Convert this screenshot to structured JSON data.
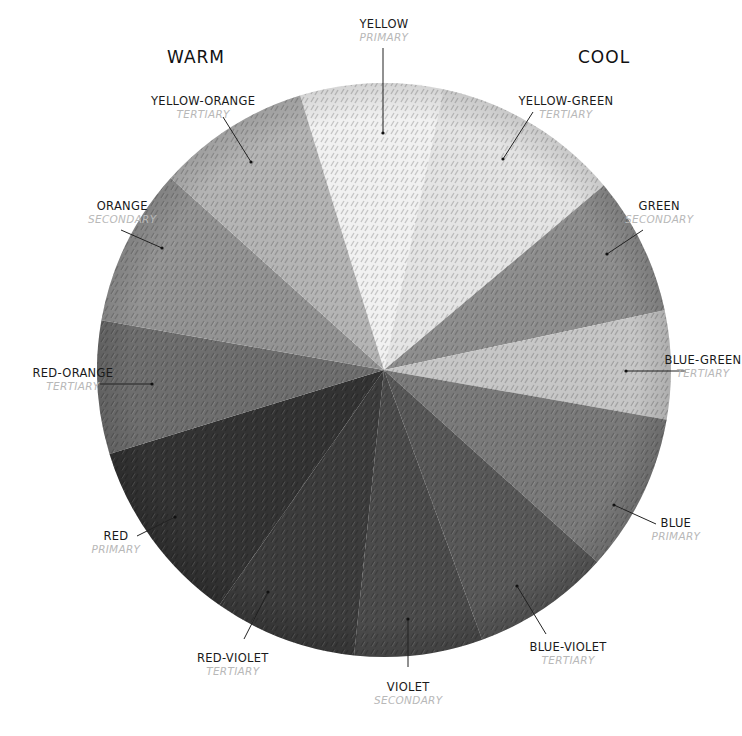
{
  "headings": {
    "warm": "WARM",
    "cool": "COOL"
  },
  "wheel": {
    "center": [
      384,
      370
    ],
    "radius": 287,
    "segments": [
      {
        "name": "YELLOW",
        "kind": "PRIMARY",
        "start": -17,
        "end": 12,
        "shade": "#f1f1f1"
      },
      {
        "name": "YELLOW-GREEN",
        "kind": "TERTIARY",
        "start": 12,
        "end": 50,
        "shade": "#e4e4e4"
      },
      {
        "name": "GREEN",
        "kind": "SECONDARY",
        "start": 50,
        "end": 78,
        "shade": "#8e8e8e"
      },
      {
        "name": "BLUE-GREEN",
        "kind": "TERTIARY",
        "start": 78,
        "end": 100,
        "shade": "#c6c6c6"
      },
      {
        "name": "BLUE",
        "kind": "PRIMARY",
        "start": 100,
        "end": 132,
        "shade": "#7a7a7a"
      },
      {
        "name": "BLUE-VIOLET",
        "kind": "TERTIARY",
        "start": 132,
        "end": 160,
        "shade": "#585858"
      },
      {
        "name": "VIOLET",
        "kind": "SECONDARY",
        "start": 160,
        "end": 186,
        "shade": "#4b4b4b"
      },
      {
        "name": "RED-VIOLET",
        "kind": "TERTIARY",
        "start": 186,
        "end": 215,
        "shade": "#3c3c3c"
      },
      {
        "name": "RED",
        "kind": "PRIMARY",
        "start": 215,
        "end": 253,
        "shade": "#333333"
      },
      {
        "name": "RED-ORANGE",
        "kind": "TERTIARY",
        "start": 253,
        "end": 280,
        "shade": "#6e6e6e"
      },
      {
        "name": "ORANGE",
        "kind": "SECONDARY",
        "start": 280,
        "end": 312,
        "shade": "#939393"
      },
      {
        "name": "YELLOW-ORANGE",
        "kind": "TERTIARY",
        "start": 312,
        "end": 343,
        "shade": "#b4b4b4"
      }
    ]
  },
  "labels": [
    {
      "name": "YELLOW",
      "kind": "PRIMARY",
      "x": 384,
      "y": 18,
      "align": "center",
      "line": [
        [
          383,
          48
        ],
        [
          383,
          133
        ]
      ]
    },
    {
      "name": "YELLOW-ORANGE",
      "kind": "TERTIARY",
      "x": 203,
      "y": 95,
      "align": "center",
      "line": [
        [
          223,
          117
        ],
        [
          251,
          162
        ]
      ]
    },
    {
      "name": "YELLOW-GREEN",
      "kind": "TERTIARY",
      "x": 566,
      "y": 95,
      "align": "center",
      "line": [
        [
          533,
          112
        ],
        [
          503,
          159
        ]
      ]
    },
    {
      "name": "ORANGE",
      "kind": "SECONDARY",
      "x": 122,
      "y": 200,
      "align": "center",
      "line": [
        [
          121,
          230
        ],
        [
          162,
          248
        ]
      ]
    },
    {
      "name": "GREEN",
      "kind": "SECONDARY",
      "x": 659,
      "y": 200,
      "align": "center",
      "line": [
        [
          643,
          230
        ],
        [
          607,
          254
        ]
      ]
    },
    {
      "name": "RED-ORANGE",
      "kind": "TERTIARY",
      "x": 73,
      "y": 367,
      "align": "center",
      "line": [
        [
          100,
          384
        ],
        [
          152,
          384
        ]
      ]
    },
    {
      "name": "BLUE-GREEN",
      "kind": "TERTIARY",
      "x": 703,
      "y": 354,
      "align": "center",
      "line": [
        [
          686,
          371
        ],
        [
          626,
          371
        ]
      ]
    },
    {
      "name": "RED",
      "kind": "PRIMARY",
      "x": 116,
      "y": 530,
      "align": "center",
      "line": [
        [
          137,
          536
        ],
        [
          175,
          517
        ]
      ]
    },
    {
      "name": "BLUE",
      "kind": "PRIMARY",
      "x": 676,
      "y": 517,
      "align": "center",
      "line": [
        [
          656,
          524
        ],
        [
          614,
          505
        ]
      ]
    },
    {
      "name": "RED-VIOLET",
      "kind": "TERTIARY",
      "x": 233,
      "y": 652,
      "align": "center",
      "line": [
        [
          244,
          639
        ],
        [
          268,
          592
        ]
      ]
    },
    {
      "name": "VIOLET",
      "kind": "SECONDARY",
      "x": 408,
      "y": 681,
      "align": "center",
      "line": [
        [
          408,
          667
        ],
        [
          408,
          619
        ]
      ]
    },
    {
      "name": "BLUE-VIOLET",
      "kind": "TERTIARY",
      "x": 568,
      "y": 641,
      "align": "center",
      "line": [
        [
          546,
          634
        ],
        [
          517,
          586
        ]
      ]
    }
  ]
}
